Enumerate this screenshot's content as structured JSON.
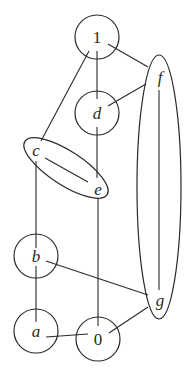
{
  "diagram": {
    "type": "graph",
    "nodes": [
      {
        "id": "n1",
        "label": "1",
        "italic": false,
        "shape": "circle",
        "cx": 97,
        "cy": 37,
        "r": 22
      },
      {
        "id": "nd",
        "label": "d",
        "italic": true,
        "shape": "circle",
        "cx": 97,
        "cy": 113,
        "r": 22
      },
      {
        "id": "nb",
        "label": "b",
        "italic": true,
        "shape": "circle",
        "cx": 36,
        "cy": 256,
        "r": 22
      },
      {
        "id": "na",
        "label": "a",
        "italic": true,
        "shape": "circle",
        "cx": 36,
        "cy": 331,
        "r": 22
      },
      {
        "id": "n0",
        "label": "0",
        "italic": false,
        "shape": "circle",
        "cx": 98,
        "cy": 339,
        "r": 22
      }
    ],
    "groups": [
      {
        "id": "ce",
        "shape": "ellipse",
        "cx": 66,
        "cy": 168,
        "rx": 49,
        "ry": 17,
        "rotate": 33,
        "members": [
          {
            "label": "c",
            "x": 36,
            "y": 150
          },
          {
            "label": "e",
            "x": 98,
            "y": 189
          }
        ]
      },
      {
        "id": "fg",
        "shape": "ellipse",
        "cx": 159,
        "cy": 187,
        "rx": 22,
        "ry": 132,
        "rotate": 0,
        "members": [
          {
            "label": "f",
            "x": 160,
            "y": 77
          },
          {
            "label": "g",
            "x": 160,
            "y": 300
          }
        ]
      }
    ],
    "edges": [
      {
        "from": "1",
        "to": "d",
        "x1": 97,
        "y1": 51,
        "x2": 97,
        "y2": 99
      },
      {
        "from": "1",
        "to": "f",
        "x1": 108,
        "y1": 44,
        "x2": 148,
        "y2": 67
      },
      {
        "from": "1",
        "to": "c",
        "x1": 89,
        "y1": 51,
        "x2": 41,
        "y2": 141
      },
      {
        "from": "d",
        "to": "f",
        "x1": 108,
        "y1": 106,
        "x2": 146,
        "y2": 84
      },
      {
        "from": "d",
        "to": "e",
        "x1": 97,
        "y1": 127,
        "x2": 97,
        "y2": 178
      },
      {
        "from": "c",
        "to": "e",
        "x1": 45,
        "y1": 158,
        "x2": 88,
        "y2": 182
      },
      {
        "from": "c",
        "to": "b",
        "x1": 36,
        "y1": 161,
        "x2": 36,
        "y2": 248
      },
      {
        "from": "f",
        "to": "g",
        "x1": 159,
        "y1": 90,
        "x2": 159,
        "y2": 290
      },
      {
        "from": "e",
        "to": "0",
        "x1": 98,
        "y1": 199,
        "x2": 98,
        "y2": 326
      },
      {
        "from": "b",
        "to": "g",
        "x1": 46,
        "y1": 261,
        "x2": 148,
        "y2": 295
      },
      {
        "from": "b",
        "to": "a",
        "x1": 36,
        "y1": 266,
        "x2": 36,
        "y2": 322
      },
      {
        "from": "a",
        "to": "0",
        "x1": 46,
        "y1": 337,
        "x2": 88,
        "y2": 334
      },
      {
        "from": "g",
        "to": "0",
        "x1": 148,
        "y1": 307,
        "x2": 109,
        "y2": 333
      }
    ]
  }
}
